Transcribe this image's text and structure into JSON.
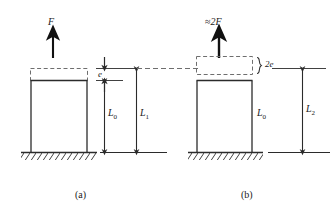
{
  "figure": {
    "title_caption_a": "(a)",
    "title_caption_b": "(b)",
    "colors": {
      "line": "#2b2b2b",
      "dash": "#6e6e6e",
      "background": "#ffffff",
      "hatch": "#2b2b2b"
    },
    "panel_a": {
      "force_label": "F",
      "extension_label": "e",
      "original_length_label": "L",
      "original_length_sub": "0",
      "stretched_length_label": "L",
      "stretched_length_sub": "1",
      "caption": "(a)"
    },
    "panel_b": {
      "force_label": "≈2F",
      "force_label_approx": "≈",
      "force_label_value": "2F",
      "extension_label": "2e",
      "original_length_label": "L",
      "original_length_sub": "0",
      "stretched_length_label": "L",
      "stretched_length_sub": "2",
      "caption": "(b)"
    }
  }
}
